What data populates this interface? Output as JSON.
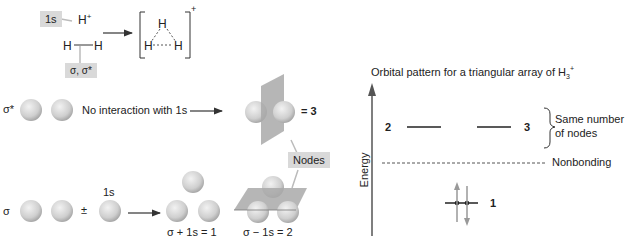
{
  "top_scheme": {
    "tag_1s": "1s",
    "h_plus": "H",
    "h_plus_charge": "+",
    "h2_left": "H",
    "h2_right": "H",
    "tag_sigma": "σ, σ*",
    "h3_top": "H",
    "h3_left": "H",
    "h3_right": "H",
    "h3_charge": "+"
  },
  "sigma_star_row": {
    "label": "σ*",
    "arrow_text": "No interaction with 1s",
    "result": "= 3"
  },
  "nodes_tag": "Nodes",
  "sigma_row": {
    "label": "σ",
    "plusminus": "±",
    "label_1s": "1s",
    "result_1": "σ + 1s = 1",
    "result_2": "σ − 1s = 2"
  },
  "energy_diagram": {
    "title": "Orbital pattern for a triangular array of H",
    "title_sub": "3",
    "title_sup": "+",
    "y_axis_label": "Energy",
    "level_2_label": "2",
    "level_3_label": "3",
    "level_1_label": "1",
    "brace_text_line1": "Same number",
    "brace_text_line2": "of nodes",
    "nonbonding_label": "Nonbonding"
  },
  "colors": {
    "sphere_fill": "#d4d4d4",
    "plane_fill": "#a9a9a9",
    "tag_bg": "#d9d9d9",
    "line": "#333333"
  }
}
